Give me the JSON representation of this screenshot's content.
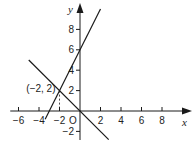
{
  "chart_data": {
    "type": "line",
    "title": "",
    "xlabel": "x",
    "ylabel": "y",
    "origin_label": "O",
    "xlim": [
      -7,
      9.5
    ],
    "ylim": [
      -2.8,
      10.5
    ],
    "xticks": [
      -6,
      -4,
      -2,
      2,
      4,
      6,
      8
    ],
    "xtick_labels": [
      "−6",
      "−4",
      "−2",
      "2",
      "4",
      "6",
      "8"
    ],
    "yticks": [
      -2,
      2,
      4,
      6,
      8
    ],
    "ytick_labels": [
      "−2",
      "2",
      "4",
      "6",
      "8"
    ],
    "grid": false,
    "series": [
      {
        "name": "y = 2x + 6",
        "slope": 2,
        "intercept": 6,
        "x_range": [
          -3.4,
          2.0
        ]
      },
      {
        "name": "y = -x",
        "slope": -1,
        "intercept": 0,
        "x_range": [
          -5.0,
          2.8
        ]
      }
    ],
    "annotations": [
      {
        "text": "(−2, 2)",
        "point": [
          -2,
          2
        ],
        "dashed_drop_to_x_axis": true
      }
    ],
    "colors": {
      "line": "#1a1a1a",
      "axis": "#1a1a1a",
      "text": "#222222"
    }
  }
}
